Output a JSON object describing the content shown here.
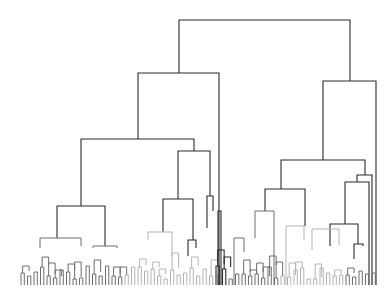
{
  "chart_data": {
    "type": "dendrogram",
    "title": "",
    "xlabel": "",
    "ylabel": "",
    "orientation": "top-down",
    "leaf_count_approx": 110,
    "leaf_labels_legible": false,
    "grid": false,
    "legend": null,
    "colors": {
      "dark": "#2a2a2a",
      "mid": "#6e6e6e",
      "light": "#b4b4b4",
      "background": "#ffffff"
    },
    "top_split": {
      "height_px": 20,
      "left_x": 179,
      "right_x": 350
    },
    "major_clusters": [
      {
        "name": "left-branch",
        "merge_y": 73,
        "x_range": [
          138,
          219
        ]
      },
      {
        "name": "right-branch",
        "merge_y": 81,
        "x_range": [
          323,
          376
        ]
      },
      {
        "name": "left-left",
        "merge_y": 139,
        "x_range": [
          81,
          194
        ]
      },
      {
        "name": "left-mid",
        "merge_y": 151,
        "x_range": [
          178,
          210
        ]
      },
      {
        "name": "right-left",
        "merge_y": 160,
        "x_range": [
          281,
          365
        ]
      },
      {
        "name": "far-left-leaves",
        "merge_y": 206,
        "x_range": [
          57,
          105
        ]
      },
      {
        "name": "mid-leaves",
        "merge_y": 199,
        "x_range": [
          163,
          193
        ]
      }
    ],
    "leaf_baseline_y": 285
  }
}
